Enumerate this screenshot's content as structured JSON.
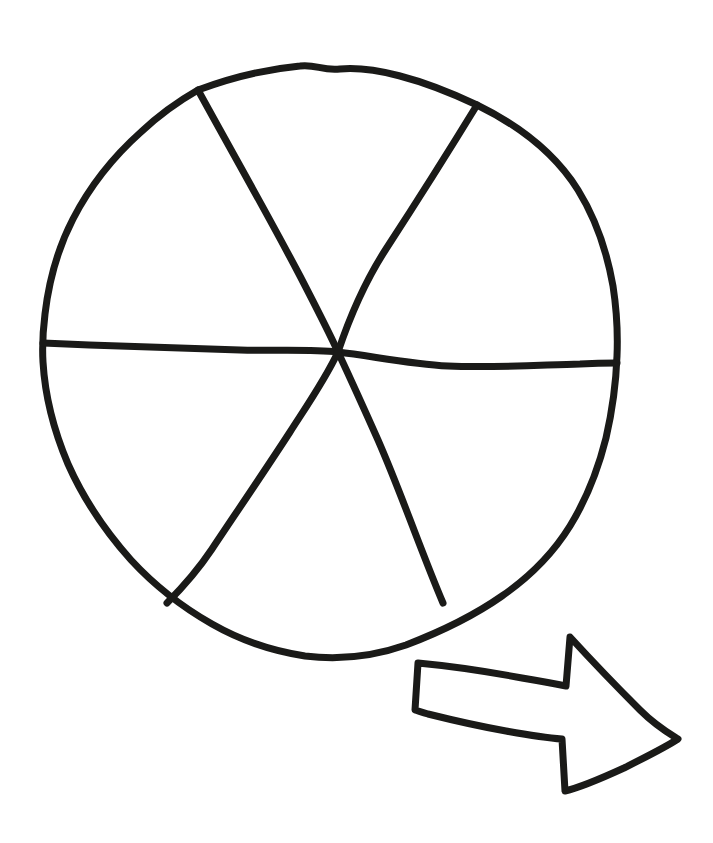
{
  "page": {
    "background_color": "#ffffff",
    "ink_color": "#1a1a18",
    "width": 713,
    "height": 843
  },
  "figure": {
    "name": "circle-divided-into-six-sectors",
    "sector_count": 6,
    "shaded_sector_count": 0,
    "center": {
      "x": 338,
      "y": 352
    },
    "stroke_width": 7,
    "outline": {
      "name": "circle-outline",
      "path": "M 198 90 C 230 78, 268 69, 300 66 C 316 64, 322 71, 340 69 C 372 66, 420 78, 477 105 C 520 126, 556 155, 578 190 C 596 219, 607 252, 613 286 C 617 312, 618 332, 617 356 C 616 384, 612 412, 606 438 C 598 470, 586 500, 570 526 C 552 555, 528 578, 502 596 C 472 617, 440 632, 406 645 C 372 657, 338 660, 305 656 C 272 651, 240 640, 212 624 C 182 607, 155 586, 131 560 C 106 532, 84 500, 68 464 C 54 431, 45 396, 43 362 C 42 345, 43 330, 45 314 C 49 280, 58 248, 73 219 C 90 186, 113 157, 141 132 C 158 116, 177 102, 198 90 Z"
    },
    "dividers": [
      {
        "name": "divider-horizontal",
        "from": {
          "x": 43,
          "y": 343
        },
        "to": {
          "x": 617,
          "y": 363
        },
        "path": "M 43 343 C 110 346, 180 348, 240 350 C 280 351, 310 349, 338 352 C 372 356, 410 364, 448 366 C 492 368, 540 365, 580 364 C 598 363, 608 363, 617 363"
      },
      {
        "name": "divider-top-left-to-bottom-right",
        "from": {
          "x": 198,
          "y": 90
        },
        "to": {
          "x": 443,
          "y": 603
        },
        "path": "M 198 90 C 232 152, 268 215, 300 276 C 314 303, 328 330, 338 352 C 352 382, 366 413, 378 440 C 392 472, 404 504, 414 530 C 424 556, 434 582, 443 603"
      },
      {
        "name": "divider-top-right-to-bottom-left",
        "from": {
          "x": 477,
          "y": 105
        },
        "to": {
          "x": 167,
          "y": 603
        },
        "path": "M 477 105 C 447 154, 414 206, 386 249 C 364 283, 348 322, 338 352 C 326 378, 308 404, 290 432 C 264 472, 236 513, 212 549 C 196 573, 179 591, 167 603"
      }
    ],
    "sectors": [
      {
        "name": "sector-top",
        "index": 1,
        "shaded": false
      },
      {
        "name": "sector-upper-right",
        "index": 2,
        "shaded": false
      },
      {
        "name": "sector-lower-right",
        "index": 3,
        "shaded": false
      },
      {
        "name": "sector-bottom",
        "index": 4,
        "shaded": false
      },
      {
        "name": "sector-lower-left",
        "index": 5,
        "shaded": false
      },
      {
        "name": "sector-upper-left",
        "index": 6,
        "shaded": false
      }
    ]
  },
  "arrow": {
    "name": "right-pointing-arrow",
    "description": "Hand-drawn hollow arrow pointing right",
    "direction": "right",
    "stroke_width": 7,
    "tip": {
      "x": 678,
      "y": 738
    },
    "tail_left": {
      "x": 417,
      "y": 663
    },
    "bounds": {
      "x": 414,
      "y": 634,
      "width": 266,
      "height": 160
    },
    "path": "M 418 663 C 450 666, 490 672, 522 678 C 540 681, 556 684, 566 686 L 570 637 C 592 661, 618 688, 640 710 C 656 726, 670 734, 678 739 C 666 747, 646 757, 624 768 C 600 779, 578 788, 565 791 L 562 739 C 548 738, 528 735, 506 731 C 478 726, 448 719, 428 714 C 422 712, 418 711, 415 710 Z"
  },
  "labels": {
    "figure_alt": "A hand-drawn circle split into six equal parts by three lines through the centre, with a hand-drawn arrow pointing to the right below it."
  }
}
